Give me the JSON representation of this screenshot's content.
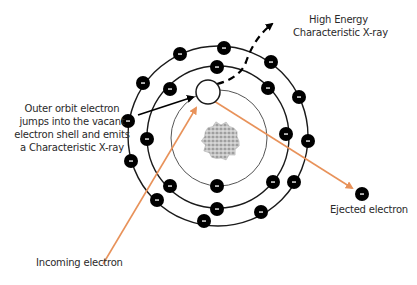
{
  "diagram": {
    "type": "atomic-model",
    "colors": {
      "background": "#ffffff",
      "orbit": "#1a1a1a",
      "inner_orbit": "#555555",
      "electron": "#000000",
      "electron_sign": "#ffffff",
      "incoming_arrow": "#e8925a",
      "ejected_arrow": "#e8925a",
      "transition_arrow": "#000000",
      "xray_path": "#000000",
      "nucleus": "#b8b8b8",
      "text": "#2a2a2a"
    },
    "nucleus": {
      "cx": 221,
      "cy": 141,
      "r": 20
    },
    "orbits": [
      {
        "name": "inner",
        "cx": 219,
        "cy": 138,
        "r": 48
      },
      {
        "name": "middle",
        "cx": 218,
        "cy": 137,
        "r": 71
      },
      {
        "name": "outer",
        "cx": 218,
        "cy": 136,
        "r": 90
      }
    ],
    "vacancy": {
      "cx": 208,
      "cy": 92,
      "r": 12
    },
    "electron_sign": "-",
    "electrons": {
      "outer": [
        [
          180,
          54
        ],
        [
          224,
          48
        ],
        [
          271,
          62
        ],
        [
          299,
          97
        ],
        [
          308,
          141
        ],
        [
          294,
          182
        ],
        [
          261,
          212
        ],
        [
          204,
          221
        ],
        [
          157,
          200
        ],
        [
          131,
          161
        ],
        [
          128,
          121
        ],
        [
          143,
          83
        ]
      ],
      "middle": [
        [
          217,
          67
        ],
        [
          268,
          88
        ],
        [
          286,
          134
        ],
        [
          273,
          182
        ],
        [
          217,
          209
        ],
        [
          170,
          186
        ],
        [
          147,
          139
        ],
        [
          170,
          89
        ]
      ],
      "inner": [
        [
          217,
          186
        ]
      ],
      "ejected": [
        362,
        194
      ]
    },
    "electron_radius": 7
  },
  "labels": {
    "xray": [
      "High Energy",
      "Characteristic X-ray"
    ],
    "transition": [
      "Outer orbit electron",
      "jumps into the vacant",
      "electron shell and emits",
      "a Characteristic X-ray"
    ],
    "ejected": "Ejected electron",
    "incoming": "Incoming electron"
  }
}
